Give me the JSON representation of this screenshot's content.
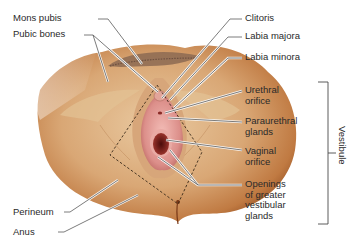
{
  "figure": {
    "colors": {
      "background": "#ffffff",
      "skin_light": "#e8c49a",
      "skin_mid": "#cf9460",
      "skin_dark": "#9a5526",
      "mucosa": "#d98a88",
      "mucosa_light": "#f0b4b0",
      "orifice": "#7a1c1a",
      "hair": "#8a6a50",
      "leader_line": "#555555",
      "dashed_outline": "#3a2a1a",
      "text": "#2a2a2a"
    }
  },
  "labels_left": [
    {
      "id": "mons-pubis",
      "text": "Mons pubis"
    },
    {
      "id": "pubic-bones",
      "text": "Pubic bones"
    },
    {
      "id": "perineum",
      "text": "Perineum"
    },
    {
      "id": "anus",
      "text": "Anus"
    }
  ],
  "labels_right": [
    {
      "id": "clitoris",
      "text": "Clitoris"
    },
    {
      "id": "labia-majora",
      "text": "Labia majora"
    },
    {
      "id": "labia-minora",
      "text": "Labia minora"
    },
    {
      "id": "urethral-orifice",
      "text": "Urethral\norifice"
    },
    {
      "id": "paraurethral-glands",
      "text": "Paraurethral\nglands"
    },
    {
      "id": "vaginal-orifice",
      "text": "Vaginal\norifice"
    },
    {
      "id": "greater-vestibular-glands",
      "text": "Openings\nof greater\nvestibular\nglands"
    }
  ],
  "bracket": {
    "id": "vestibule",
    "text": "Vestibule"
  }
}
